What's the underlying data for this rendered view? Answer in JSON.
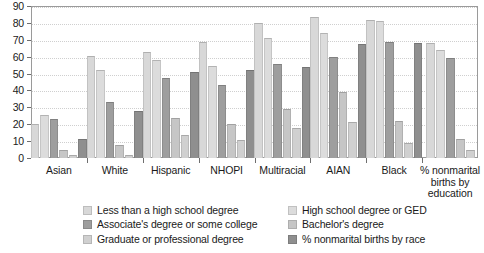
{
  "chart_data": {
    "type": "bar",
    "title": "",
    "subtitle": "",
    "xlabel": "",
    "ylabel": "",
    "ylim": [
      0,
      90
    ],
    "ytick_step": 10,
    "yticks": [
      90,
      80,
      70,
      60,
      50,
      40,
      30,
      20,
      10,
      0
    ],
    "grid": true,
    "legend_position": "bottom",
    "categories": [
      "Asian",
      "White",
      "Hispanic",
      "NHOPI",
      "Multiracial",
      "AIAN",
      "Black",
      "% nonmarital\nbirths by\neducation"
    ],
    "series": [
      {
        "name": "Less than a high school degree",
        "color": "#d8d8d8",
        "values": [
          20,
          60.5,
          63,
          68.5,
          80,
          83.5,
          82,
          68
        ]
      },
      {
        "name": "High school degree or GED",
        "color": "#dcdcdc",
        "values": [
          25.5,
          52,
          58,
          54.5,
          71,
          74,
          81,
          64
        ]
      },
      {
        "name": "Associate's degree or some college",
        "color": "#9e9e9e",
        "values": [
          23,
          33,
          47.5,
          43.5,
          55.5,
          60,
          68.5,
          59
        ]
      },
      {
        "name": "Bachelor's degree",
        "color": "#c6c6c6",
        "values": [
          5,
          8,
          23.5,
          20,
          29,
          39,
          22,
          11.5
        ]
      },
      {
        "name": "Graduate or professional degree",
        "color": "#d0d0d0",
        "values": [
          1.5,
          2,
          13.5,
          10.5,
          17.5,
          21.5,
          9,
          5
        ]
      },
      {
        "name": "% nonmarital births by race",
        "color": "#8f8f8f",
        "values": [
          11,
          28,
          51,
          52,
          54,
          67.5,
          68,
          null
        ]
      }
    ]
  },
  "axis": {
    "y_tick_labels": [
      "90",
      "80",
      "70",
      "60",
      "50",
      "40",
      "30",
      "20",
      "10",
      "0"
    ],
    "x_tick_labels": [
      "Asian",
      "White",
      "Hispanic",
      "NHOPI",
      "Multiracial",
      "AIAN",
      "Black",
      "% nonmarital\nbirths by\neducation"
    ]
  },
  "legend": {
    "items": [
      {
        "label": "Less than a high school degree",
        "color": "#d8d8d8"
      },
      {
        "label": "High school degree or GED",
        "color": "#dcdcdc"
      },
      {
        "label": "Associate's degree or some college",
        "color": "#9e9e9e"
      },
      {
        "label": "Bachelor's degree",
        "color": "#c6c6c6"
      },
      {
        "label": "Graduate or professional degree",
        "color": "#d0d0d0"
      },
      {
        "label": "% nonmarital births by race",
        "color": "#8f8f8f"
      }
    ],
    "order": [
      0,
      1,
      2,
      3,
      4,
      5
    ]
  }
}
